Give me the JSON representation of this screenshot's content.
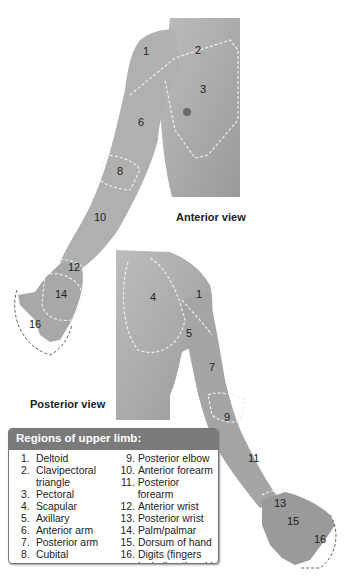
{
  "figure": {
    "anterior_label": "Anterior view",
    "posterior_label": "Posterior view",
    "anterior_numbers": [
      {
        "n": "1",
        "x": 143,
        "y": 46
      },
      {
        "n": "2",
        "x": 195,
        "y": 45
      },
      {
        "n": "3",
        "x": 200,
        "y": 84
      },
      {
        "n": "6",
        "x": 138,
        "y": 117
      },
      {
        "n": "8",
        "x": 117,
        "y": 166
      },
      {
        "n": "10",
        "x": 94,
        "y": 212
      },
      {
        "n": "12",
        "x": 68,
        "y": 262
      },
      {
        "n": "14",
        "x": 55,
        "y": 289
      },
      {
        "n": "16",
        "x": 29,
        "y": 319
      }
    ],
    "posterior_numbers": [
      {
        "n": "4",
        "x": 150,
        "y": 292
      },
      {
        "n": "1",
        "x": 196,
        "y": 289
      },
      {
        "n": "5",
        "x": 186,
        "y": 328
      },
      {
        "n": "7",
        "x": 209,
        "y": 362
      },
      {
        "n": "9",
        "x": 224,
        "y": 412
      },
      {
        "n": "11",
        "x": 248,
        "y": 453
      },
      {
        "n": "13",
        "x": 274,
        "y": 498
      },
      {
        "n": "15",
        "x": 287,
        "y": 516
      },
      {
        "n": "16",
        "x": 314,
        "y": 534
      }
    ]
  },
  "legend": {
    "title": "Regions of upper limb:",
    "left": [
      {
        "num": "1.",
        "label": "Deltoid"
      },
      {
        "num": "2.",
        "label": "Clavipectoral"
      },
      {
        "num": "",
        "label": "triangle"
      },
      {
        "num": "3.",
        "label": "Pectoral"
      },
      {
        "num": "4.",
        "label": "Scapular"
      },
      {
        "num": "5.",
        "label": "Axillary"
      },
      {
        "num": "6.",
        "label": "Anterior arm"
      },
      {
        "num": "7.",
        "label": "Posterior arm"
      },
      {
        "num": "8.",
        "label": "Cubital"
      }
    ],
    "right": [
      {
        "num": "9.",
        "label": "Posterior elbow"
      },
      {
        "num": "10.",
        "label": "Anterior forearm"
      },
      {
        "num": "11.",
        "label": "Posterior forearm"
      },
      {
        "num": "12.",
        "label": "Anterior wrist"
      },
      {
        "num": "13.",
        "label": "Posterior wrist"
      },
      {
        "num": "14.",
        "label": "Palm/palmar"
      },
      {
        "num": "15.",
        "label": "Dorsum of hand"
      },
      {
        "num": "16.",
        "label": "Digits (fingers"
      },
      {
        "num": "",
        "label": "including thumb)"
      }
    ]
  }
}
